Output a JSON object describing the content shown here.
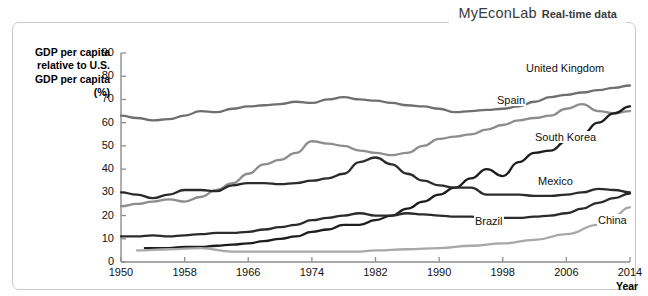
{
  "banner": {
    "brand": "MyEconLab",
    "suffix": "Real-time data"
  },
  "axis": {
    "ylabel": "GDP per capita relative to U.S. GDP per capita (%)",
    "xlabel": "Year",
    "yticks": [
      "0",
      "10",
      "20",
      "30",
      "40",
      "50",
      "60",
      "70",
      "80",
      "90"
    ],
    "xticks": [
      "1950",
      "1958",
      "1966",
      "1974",
      "1982",
      "1990",
      "1998",
      "2006",
      "2014"
    ]
  },
  "annotations": {
    "united_kingdom": "United Kingdom",
    "spain": "Spain",
    "south_korea": "South Korea",
    "mexico": "Mexico",
    "brazil": "Brazil",
    "china": "China"
  },
  "colors": {
    "dark": "#3a3a3a",
    "mid": "#6f6f6f",
    "light": "#a8a8a8",
    "axis": "#8d8d8d",
    "frame": "#c9c9c9",
    "text": "#111111"
  },
  "chart_data": {
    "type": "line",
    "title": "",
    "xlabel": "Year",
    "ylabel": "GDP per capita relative to U.S. GDP per capita (%)",
    "xlim": [
      1950,
      2014
    ],
    "ylim": [
      0,
      90
    ],
    "xticks": [
      1950,
      1958,
      1966,
      1974,
      1982,
      1990,
      1998,
      2006,
      2014
    ],
    "yticks": [
      0,
      10,
      20,
      30,
      40,
      50,
      60,
      70,
      80,
      90
    ],
    "grid": false,
    "legend": "inline-labels",
    "series": [
      {
        "name": "United Kingdom",
        "color": "#6f6f6f",
        "x": [
          1950,
          1952,
          1954,
          1956,
          1958,
          1960,
          1962,
          1964,
          1966,
          1968,
          1970,
          1972,
          1974,
          1976,
          1978,
          1980,
          1982,
          1984,
          1986,
          1988,
          1990,
          1992,
          1994,
          1996,
          1998,
          2000,
          2002,
          2004,
          2006,
          2008,
          2010,
          2012,
          2014
        ],
        "values": [
          63,
          62,
          61,
          61.5,
          63,
          65,
          64.5,
          66,
          67,
          67.5,
          68,
          69,
          68.5,
          70,
          71,
          70,
          69.5,
          68.5,
          67.5,
          67,
          66,
          64.5,
          65,
          65.5,
          66,
          67,
          69,
          71,
          72,
          73,
          74,
          75,
          76
        ]
      },
      {
        "name": "Spain",
        "color": "#8d8d8d",
        "x": [
          1950,
          1952,
          1954,
          1956,
          1958,
          1960,
          1962,
          1964,
          1966,
          1968,
          1970,
          1972,
          1974,
          1976,
          1978,
          1980,
          1982,
          1984,
          1986,
          1988,
          1990,
          1992,
          1994,
          1996,
          1998,
          2000,
          2002,
          2004,
          2006,
          2008,
          2010,
          2012,
          2014
        ],
        "values": [
          24,
          25,
          26,
          27,
          26,
          28,
          31,
          34,
          38,
          42,
          44,
          47,
          52,
          51,
          50,
          48,
          47,
          46,
          47,
          50,
          53,
          54,
          55,
          57,
          59,
          61,
          62,
          63,
          66,
          68,
          65,
          64,
          65
        ]
      },
      {
        "name": "South Korea",
        "color": "#1d1d1d",
        "x": [
          1953,
          1956,
          1958,
          1960,
          1962,
          1964,
          1966,
          1968,
          1970,
          1972,
          1974,
          1976,
          1978,
          1980,
          1982,
          1984,
          1986,
          1988,
          1990,
          1992,
          1994,
          1996,
          1998,
          2000,
          2002,
          2004,
          2006,
          2008,
          2010,
          2012,
          2014
        ],
        "values": [
          6,
          6,
          6.5,
          6.5,
          7,
          7.5,
          8,
          9,
          10,
          11,
          13,
          14,
          16,
          16,
          18,
          20,
          23,
          26,
          29,
          32,
          36,
          40,
          37,
          43,
          47,
          48,
          52,
          55,
          60,
          64,
          67
        ]
      },
      {
        "name": "Mexico",
        "color": "#2b2b2b",
        "x": [
          1950,
          1952,
          1954,
          1956,
          1958,
          1960,
          1962,
          1964,
          1966,
          1968,
          1970,
          1972,
          1974,
          1976,
          1978,
          1980,
          1982,
          1984,
          1986,
          1988,
          1990,
          1992,
          1994,
          1996,
          1998,
          2000,
          2002,
          2004,
          2006,
          2008,
          2010,
          2012,
          2014
        ],
        "values": [
          30,
          29,
          27.5,
          29,
          31,
          31,
          30.5,
          33,
          34,
          34,
          33.5,
          34,
          35,
          36,
          38,
          43,
          45,
          42,
          38,
          35,
          33,
          32,
          32,
          29,
          29,
          29,
          28.5,
          28.5,
          29,
          30,
          31.5,
          31,
          30
        ]
      },
      {
        "name": "Brazil",
        "color": "#2b2b2b",
        "x": [
          1950,
          1952,
          1954,
          1956,
          1958,
          1960,
          1962,
          1964,
          1966,
          1968,
          1970,
          1972,
          1974,
          1976,
          1978,
          1980,
          1982,
          1984,
          1986,
          1988,
          1990,
          1992,
          1994,
          1996,
          1998,
          2000,
          2002,
          2004,
          2006,
          2008,
          2010,
          2012,
          2014
        ],
        "values": [
          11,
          11,
          11.5,
          11,
          11.5,
          12,
          12.5,
          12.5,
          13,
          14,
          15,
          16,
          18,
          19,
          20,
          21,
          20,
          20,
          21,
          20.5,
          20,
          19.5,
          19.5,
          19,
          19,
          19,
          19.5,
          20,
          21,
          23,
          25.5,
          27.5,
          29.5
        ]
      },
      {
        "name": "China",
        "color": "#a8a8a8",
        "x": [
          1952,
          1956,
          1960,
          1964,
          1968,
          1972,
          1976,
          1980,
          1982,
          1986,
          1990,
          1994,
          1998,
          2002,
          2006,
          2010,
          2012,
          2014
        ],
        "values": [
          5,
          5.5,
          6,
          4.5,
          4.5,
          4.5,
          4.5,
          4.5,
          5,
          5.5,
          6,
          7,
          8,
          9.5,
          12,
          16,
          20,
          23.5
        ]
      }
    ]
  }
}
